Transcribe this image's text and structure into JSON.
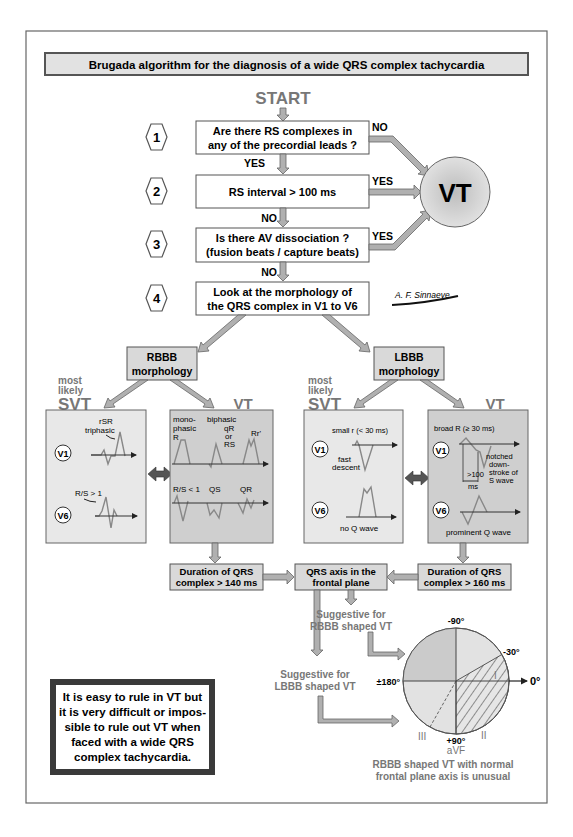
{
  "title": "Brugada algorithm for the diagnosis of a wide QRS complex tachycardia",
  "start_label": "START",
  "steps": [
    {
      "number": "1",
      "lines": [
        "Are there RS complexes in",
        "any of the precordial leads ?"
      ],
      "down_label": "YES",
      "side_label": "NO"
    },
    {
      "number": "2",
      "lines": [
        "RS interval > 100 ms"
      ],
      "down_label": "NO",
      "side_label": "YES"
    },
    {
      "number": "3",
      "lines": [
        "Is there AV dissociation ?",
        "(fusion beats / capture beats)"
      ],
      "down_label": "NO",
      "side_label": "YES"
    },
    {
      "number": "4",
      "lines": [
        "Look at the morphology of",
        "the QRS complex in V1 to V6"
      ]
    }
  ],
  "vt_circle_label": "VT",
  "signature": "A. F. Sinnaeve",
  "rbbb": {
    "box_lines": [
      "RBBB",
      "morphology"
    ],
    "svt_header": {
      "most": "most",
      "likely": "likely",
      "label": "SVT"
    },
    "vt_header": "VT",
    "svt_panel": {
      "v1": {
        "lead": "V1",
        "annot1": "rSR",
        "annot2": "triphasic"
      },
      "v6": {
        "lead": "V6",
        "annot": "R/S > 1"
      }
    },
    "vt_panel": {
      "top": {
        "mono1": "mono-",
        "mono2": "phasic",
        "mono3": "R",
        "bi1": "biphasic",
        "bi2": "qR",
        "bi3": "or",
        "bi4": "RS",
        "rr": "Rr'"
      },
      "bottom": {
        "rs": "R/S < 1",
        "qs": "QS",
        "qr": "QR"
      }
    },
    "duration_lines": [
      "Duration of QRS",
      "complex > 140 ms"
    ]
  },
  "lbbb": {
    "box_lines": [
      "LBBB",
      "morphology"
    ],
    "svt_header": {
      "most": "most",
      "likely": "likely",
      "label": "SVT"
    },
    "vt_header": "VT",
    "svt_panel": {
      "v1": {
        "lead": "V1",
        "annot1": "small r (< 30 ms)",
        "annot2": "fast",
        "annot3": "descent"
      },
      "v6": {
        "lead": "V6",
        "annot": "no Q wave"
      }
    },
    "vt_panel": {
      "v1": {
        "lead": "V1",
        "annot1": "broad R (≥ 30 ms)",
        "notch1": "notched",
        "notch2": "down-",
        "notch3": "stroke of",
        "notch4": "S wave",
        "interval1": ">100",
        "interval2": "ms"
      },
      "v6": {
        "lead": "V6",
        "annot": "prominent Q wave"
      }
    },
    "duration_lines": [
      "Duration of QRS",
      "complex > 160 ms"
    ]
  },
  "axis_box_lines": [
    "QRS axis in the",
    "frontal plane"
  ],
  "suggestive_rbbb": [
    "Suggestive for",
    "RBBB shaped VT"
  ],
  "suggestive_lbbb": [
    "Suggestive for",
    "LBBB shaped VT"
  ],
  "axis_wheel": {
    "top": "-90°",
    "upper_right": "-30°",
    "right": "0°",
    "left": "±180°",
    "bottom": "+90°",
    "lead_I": "I",
    "lead_II": "II",
    "lead_III": "III",
    "lead_aVF": "aVF"
  },
  "axis_note": [
    "RBBB shaped VT with normal",
    "frontal plane axis is unusual"
  ],
  "rule_box_lines": [
    "It is easy to rule in VT but",
    "it is very difficult or impos-",
    "sible to rule out VT when",
    "faced with a wide QRS",
    "complex tachycardia."
  ],
  "colors": {
    "frame": "#666666",
    "box_gray": "#d9d9d9",
    "panel_light": "#e8e8e8",
    "panel_dark": "#cfcfcf",
    "header_gray": "#666666",
    "arrow": "#b0b0b0"
  }
}
